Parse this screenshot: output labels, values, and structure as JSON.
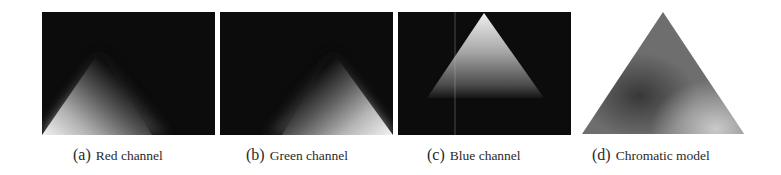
{
  "figure": {
    "panels": [
      {
        "id": "a",
        "tag": "(a)",
        "label": "Red channel",
        "background": "#0c0c0c"
      },
      {
        "id": "b",
        "tag": "(b)",
        "label": "Green channel",
        "background": "#0c0c0c"
      },
      {
        "id": "c",
        "tag": "(c)",
        "label": "Blue channel",
        "background": "#0c0c0c"
      },
      {
        "id": "d",
        "tag": "(d)",
        "label": "Chromatic model",
        "background": "#ffffff"
      }
    ]
  }
}
